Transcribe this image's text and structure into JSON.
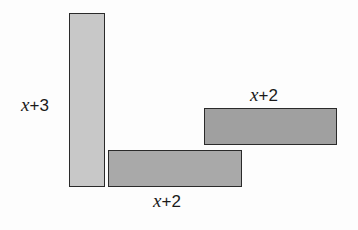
{
  "diagram": {
    "shapes": [
      {
        "id": "tall-rect",
        "label": "x+3",
        "var": "x",
        "op": "+",
        "num": "3",
        "color": "#c8c8c8"
      },
      {
        "id": "bottom-rect",
        "label": "x+2",
        "var": "x",
        "op": "+",
        "num": "2",
        "color": "#a9a9a9"
      },
      {
        "id": "right-rect",
        "label": "x+2",
        "var": "x",
        "op": "+",
        "num": "2",
        "color": "#a0a0a0"
      }
    ]
  }
}
